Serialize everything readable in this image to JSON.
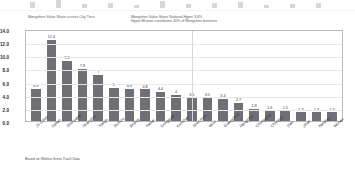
{
  "slide": {
    "title_left": "Mongshen Value Share across City Tiers",
    "annotation_line1": "Mongshen Value Share National Hyper 3.8%",
    "annotation_line2": "Hyper Mianan contributes 40% of Mongshen business",
    "source_note": "Based on Wofeia Gross Track Data",
    "bar_color": "#6f6f76",
    "frame_color": "#b9b9bf",
    "grid_color": "#e8e8ec"
  },
  "chart_data": {
    "type": "bar",
    "title": "Mongshen Value Share across City Tiers",
    "xlabel": "",
    "ylabel": "",
    "ylim": [
      0,
      14
    ],
    "yticks": [
      "14.0",
      "12.0",
      "10.0",
      "8.0",
      "6.0",
      "4.0",
      "2.0",
      "0.0"
    ],
    "ytick_values": [
      14,
      12,
      10,
      8,
      6,
      4,
      2,
      0
    ],
    "grid": true,
    "legend": "none",
    "categories": [
      "15 Cities",
      "Dalian",
      "Shenyang",
      "Shanghai",
      "Tianjin",
      "Suzhou",
      "Beijing",
      "Yantai",
      "Dongguan",
      "Kunshan",
      "Shenzhen",
      "Wuxi",
      "Guangzhou",
      "Hangzhou",
      "Chongqing",
      "Chengdu",
      "Xian",
      "Jinan",
      "Nanjing",
      "Wuhan"
    ],
    "values": [
      4.9,
      12.4,
      9.2,
      7.9,
      7,
      5,
      4.9,
      4.8,
      4.4,
      4,
      3.5,
      3.5,
      3.4,
      2.7,
      1.9,
      1.6,
      1.5,
      1.3,
      1.3,
      1.3
    ],
    "value_labels": [
      "4.9",
      "12.4",
      "9.2",
      "7.9",
      "7",
      "5",
      "4.9",
      "4.8",
      "4.4",
      "4",
      "3.5",
      "3.5",
      "3.4",
      "2.7",
      "1.9",
      "1.6",
      "1.5",
      "1.3",
      "1.3",
      "1.3"
    ]
  },
  "top_ghost": {
    "tick_labels": [
      "",
      "",
      "",
      "",
      ""
    ],
    "bar_heights": [
      6,
      8,
      4,
      5,
      3,
      7,
      4,
      5,
      6,
      3,
      4,
      5
    ]
  }
}
